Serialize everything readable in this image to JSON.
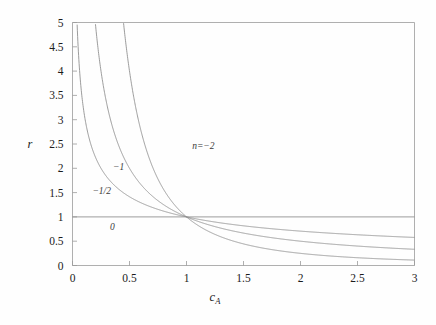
{
  "chart_data": {
    "type": "line",
    "title": "",
    "subtitle": "",
    "xlabel": "c_A",
    "xlabel_base": "c",
    "xlabel_sub": "A",
    "ylabel": "r",
    "xlim": [
      0,
      3
    ],
    "ylim": [
      0,
      5
    ],
    "grid": false,
    "legend_position": "inline-annotations",
    "x_ticks": [
      "0",
      "0.5",
      "1",
      "1.5",
      "2",
      "2.5",
      "3"
    ],
    "x_tick_values": [
      0,
      0.5,
      1,
      1.5,
      2,
      2.5,
      3
    ],
    "y_ticks": [
      "0",
      "0.5",
      "1",
      "1.5",
      "2",
      "2.5",
      "3",
      "3.5",
      "4",
      "4.5",
      "5"
    ],
    "y_tick_values": [
      0,
      0.5,
      1,
      1.5,
      2,
      2.5,
      3,
      3.5,
      4,
      4.5,
      5
    ],
    "relation": "r = c_A^n",
    "line_color": "#8a8a8a",
    "axis_color": "#9a9a9a",
    "background_color": "#fefefe",
    "series": [
      {
        "name": "n=-2",
        "label": "n=−2",
        "exponent": -2,
        "label_x": 1.05,
        "label_y": 2.45,
        "points_x": [
          0.45,
          0.5,
          0.6,
          0.7,
          0.8,
          0.9,
          1.0,
          1.2,
          1.4,
          1.6,
          1.8,
          2.0,
          2.25,
          2.5,
          2.75,
          3.0
        ],
        "points_y": [
          4.94,
          4.0,
          2.78,
          2.04,
          1.56,
          1.23,
          1.0,
          0.694,
          0.51,
          0.391,
          0.309,
          0.25,
          0.198,
          0.16,
          0.132,
          0.111
        ]
      },
      {
        "name": "n=-1",
        "label": "−1",
        "exponent": -1,
        "label_x": 0.355,
        "label_y": 2.0,
        "points_x": [
          0.2,
          0.25,
          0.3,
          0.4,
          0.5,
          0.6,
          0.8,
          1.0,
          1.25,
          1.5,
          1.75,
          2.0,
          2.25,
          2.5,
          2.75,
          3.0
        ],
        "points_y": [
          5.0,
          4.0,
          3.33,
          2.5,
          2.0,
          1.667,
          1.25,
          1.0,
          0.8,
          0.667,
          0.571,
          0.5,
          0.444,
          0.4,
          0.364,
          0.333
        ]
      },
      {
        "name": "n=-1/2",
        "label": "−1/2",
        "exponent": -0.5,
        "label_x": 0.175,
        "label_y": 1.52,
        "points_x": [
          0.04,
          0.06,
          0.1,
          0.15,
          0.2,
          0.3,
          0.4,
          0.6,
          0.8,
          1.0,
          1.4,
          1.8,
          2.2,
          2.6,
          3.0
        ],
        "points_y": [
          5.0,
          4.08,
          3.162,
          2.582,
          2.236,
          1.826,
          1.581,
          1.291,
          1.118,
          1.0,
          0.845,
          0.745,
          0.674,
          0.62,
          0.577
        ]
      },
      {
        "name": "n=0",
        "label": "0",
        "exponent": 0,
        "label_x": 0.33,
        "label_y": 0.78,
        "points_x": [
          0,
          3
        ],
        "points_y": [
          1,
          1
        ]
      }
    ]
  },
  "figure": {
    "caption": ""
  }
}
